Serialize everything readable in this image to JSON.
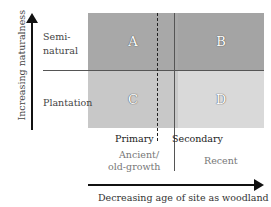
{
  "axes": {
    "y_label": "Increasing naturalness",
    "x_label": "Decreasing age of site as woodland"
  },
  "rows": {
    "top": "Semi-\nnatural",
    "top_line1": "Semi-",
    "top_line2": "natural",
    "bottom": "Plantation"
  },
  "columns": {
    "primary": "Primary",
    "secondary": "Secondary",
    "ancient_line1": "Ancient/",
    "ancient_line2": "old-growth",
    "recent": "Recent"
  },
  "cells": {
    "a": "A",
    "b": "B",
    "c": "C",
    "d": "D"
  },
  "colors": {
    "top_fill": "#a6a6a6",
    "bottom_fill": "#c8c8c8",
    "d_fill": "#d8d8d8",
    "line": "#222222"
  }
}
